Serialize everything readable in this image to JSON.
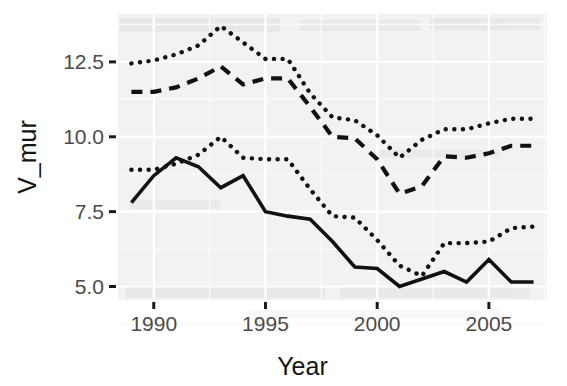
{
  "chart_data": {
    "type": "line",
    "title": "",
    "subtitle": "",
    "xlabel": "Year",
    "ylabel": "V_mur",
    "xlim": [
      1988.4,
      2007.6
    ],
    "ylim": [
      4.55,
      14.1
    ],
    "x": [
      1989,
      1990,
      1991,
      1992,
      1993,
      1994,
      1995,
      1996,
      1997,
      1998,
      1999,
      2000,
      2001,
      2002,
      2003,
      2004,
      2005,
      2006,
      2007
    ],
    "xticks": [
      1990,
      1995,
      2000,
      2005
    ],
    "xtick_labels": [
      "1990",
      "1995",
      "2000",
      "2005"
    ],
    "yticks": [
      5.0,
      7.5,
      10.0,
      12.5
    ],
    "ytick_labels": [
      "5.0",
      "7.5",
      "10.0",
      "12.5"
    ],
    "grid": true,
    "legend": "none",
    "series": [
      {
        "name": "upper-dotted-bound",
        "style": "dotted",
        "values": [
          12.45,
          12.55,
          12.75,
          13.05,
          13.7,
          13.15,
          12.6,
          12.6,
          11.45,
          10.65,
          10.55,
          10.05,
          9.3,
          9.9,
          10.25,
          10.25,
          10.45,
          10.6,
          10.6
        ]
      },
      {
        "name": "mean-dashed",
        "style": "dashed",
        "values": [
          11.5,
          11.5,
          11.65,
          11.95,
          12.35,
          11.75,
          11.95,
          11.95,
          11.0,
          10.0,
          9.95,
          9.25,
          8.1,
          8.35,
          9.35,
          9.3,
          9.45,
          9.7,
          9.7
        ]
      },
      {
        "name": "lower-dotted-bound",
        "style": "dotted",
        "values": [
          8.9,
          8.9,
          9.1,
          9.4,
          10.0,
          9.3,
          9.25,
          9.25,
          8.25,
          7.35,
          7.3,
          6.55,
          5.7,
          5.35,
          6.45,
          6.45,
          6.5,
          6.95,
          7.0
        ]
      },
      {
        "name": "observed-solid",
        "style": "solid",
        "values": [
          7.8,
          8.7,
          9.3,
          9.0,
          8.3,
          8.7,
          7.5,
          7.35,
          7.25,
          6.5,
          5.65,
          5.6,
          5.0,
          5.25,
          5.5,
          5.15,
          5.9,
          5.15,
          5.15
        ]
      }
    ]
  },
  "layout": {
    "plot_left": 118,
    "plot_right": 547,
    "plot_top": 14,
    "plot_bottom": 300
  }
}
